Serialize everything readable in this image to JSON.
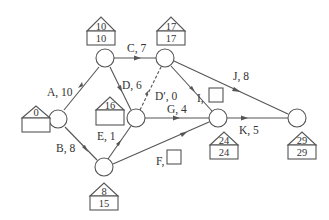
{
  "diagram": {
    "type": "activity-on-arrow network (CPM)",
    "nodes": [
      {
        "id": "n1",
        "x": 58,
        "y": 119,
        "early": "0",
        "late": ""
      },
      {
        "id": "n2",
        "x": 105,
        "y": 58,
        "early": "10",
        "late": "10"
      },
      {
        "id": "n3",
        "x": 165,
        "y": 58,
        "early": "17",
        "late": "17"
      },
      {
        "id": "n4",
        "x": 136,
        "y": 118,
        "early": "16",
        "late": ""
      },
      {
        "id": "n5",
        "x": 104,
        "y": 167,
        "early": "8",
        "late": "15"
      },
      {
        "id": "n6",
        "x": 218,
        "y": 118,
        "early": "24",
        "late": "24"
      },
      {
        "id": "n7",
        "x": 297,
        "y": 118,
        "early": "29",
        "late": "29"
      }
    ],
    "edges": [
      {
        "id": "A",
        "label": "A, 10",
        "from": "n1",
        "to": "n2"
      },
      {
        "id": "B",
        "label": "B, 8",
        "from": "n1",
        "to": "n5"
      },
      {
        "id": "C",
        "label": "C, 7",
        "from": "n2",
        "to": "n3"
      },
      {
        "id": "D",
        "label": "D, 6",
        "from": "n2",
        "to": "n4"
      },
      {
        "id": "Dp",
        "label": "D′, 0",
        "from": "n4",
        "to": "n3",
        "dummy": true
      },
      {
        "id": "E",
        "label": "E, 1",
        "from": "n5",
        "to": "n4"
      },
      {
        "id": "G",
        "label": "G, 4",
        "from": "n4",
        "to": "n6"
      },
      {
        "id": "I",
        "label": "I,",
        "from": "n3",
        "to": "n6",
        "blank_box": true
      },
      {
        "id": "F",
        "label": "F,",
        "from": "n5",
        "to": "n6",
        "blank_box": true
      },
      {
        "id": "J",
        "label": "J, 8",
        "from": "n3",
        "to": "n7"
      },
      {
        "id": "K",
        "label": "K, 5",
        "from": "n6",
        "to": "n7"
      }
    ]
  }
}
